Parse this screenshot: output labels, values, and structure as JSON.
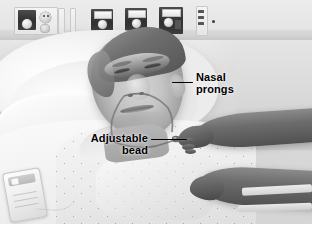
{
  "figure": {
    "name": "clinical-photograph-nasal-cannula",
    "width": 312,
    "height": 227,
    "rendering": "grayscale-photograph",
    "scene_description": "Elderly male patient lying in a hospital bed wearing a nasal cannula; a caregiver's hands reach in from the right to adjust the tubing."
  },
  "annotations": [
    {
      "id": "nasal-prongs",
      "label_line_1": "Nasal",
      "label_line_2": "prongs",
      "text_color": "#000000",
      "leader_color": "#000000",
      "leader_side": "left",
      "points_to": "nasal cannula prongs at the patient's nostrils"
    },
    {
      "id": "adjustable-bead",
      "label_line_1": "Adjustable",
      "label_line_2": "bead",
      "text_color": "#000000",
      "leader_color": "#000000",
      "leader_side": "right",
      "points_to": "sliding bead on the cannula tubing under the chin"
    }
  ],
  "scene_objects": {
    "wall_panels": [
      {
        "name": "electrical-outlet-panel",
        "description": "dark recessed plate with round outlet and knob"
      },
      {
        "name": "gas-outlet-oxygen",
        "description": "wall gas outlet port"
      },
      {
        "name": "gas-outlet-air",
        "description": "wall gas outlet port"
      },
      {
        "name": "gas-outlet-suction",
        "description": "wall gas outlet port"
      },
      {
        "name": "switch-plate",
        "description": "narrow vertical switch plate"
      }
    ],
    "bed_items": [
      {
        "name": "pillow",
        "description": "white hospital pillow behind the patient's head"
      },
      {
        "name": "bed-sheet",
        "description": "white folded bed linen"
      },
      {
        "name": "patient-gown",
        "description": "speckled-print hospital gown"
      },
      {
        "name": "nurse-call-remote",
        "description": "handheld call button device clipped to the bedding"
      }
    ],
    "person": {
      "name": "patient",
      "description": "elderly male, grey hair, eyes closed, wearing nasal cannula"
    },
    "caregiver": {
      "name": "caregiver-hands",
      "description": "two forearms and hands entering from the right edge of the frame"
    }
  },
  "colors": {
    "annotation_text": "#000000",
    "leader_line": "#000000",
    "background": "#ffffff",
    "photo_light": "#f4f3f1",
    "photo_mid": "#c6c2bc",
    "photo_dark": "#47443f"
  }
}
